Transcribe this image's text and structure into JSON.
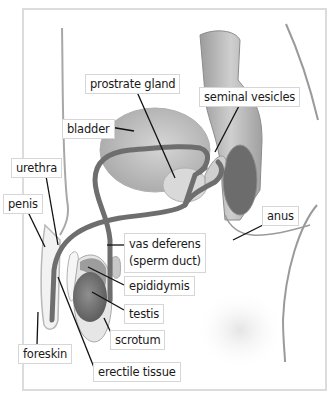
{
  "diagram": {
    "labels": [
      {
        "id": "prostrate-gland",
        "text": "prostrate gland",
        "x": 85,
        "y": 74
      },
      {
        "id": "seminal-vesicles",
        "text": "seminal vesicles",
        "x": 199,
        "y": 87
      },
      {
        "id": "bladder",
        "text": "bladder",
        "x": 62,
        "y": 119
      },
      {
        "id": "urethra",
        "text": "urethra",
        "x": 11,
        "y": 158
      },
      {
        "id": "penis",
        "text": "penis",
        "x": 3,
        "y": 194
      },
      {
        "id": "anus",
        "text": "anus",
        "x": 262,
        "y": 206
      },
      {
        "id": "vas-deferens",
        "text": "vas deferens",
        "text2": "(sperm duct)",
        "x": 124,
        "y": 233
      },
      {
        "id": "epididymis",
        "text": "epididymis",
        "x": 124,
        "y": 276
      },
      {
        "id": "testis",
        "text": "testis",
        "x": 124,
        "y": 304
      },
      {
        "id": "scrotum",
        "text": "scrotum",
        "x": 110,
        "y": 330
      },
      {
        "id": "foreskin",
        "text": "foreskin",
        "x": 18,
        "y": 344
      },
      {
        "id": "erectile-tissue",
        "text": "erectile tissue",
        "x": 93,
        "y": 362
      }
    ],
    "colors": {
      "frame": "#dcdcdc",
      "duct": "#6e6e6e",
      "organ": "#bdbdbd",
      "organ_dark": "#8a8a8a",
      "skin_outline": "#9a9a9a",
      "leader": "#111111"
    }
  }
}
